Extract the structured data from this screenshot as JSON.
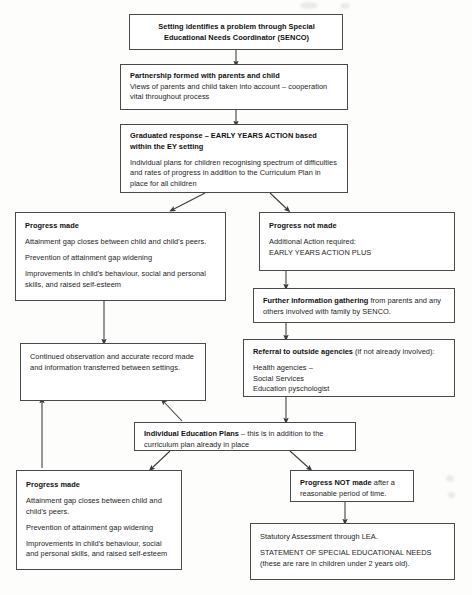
{
  "diagram": {
    "nodes": [
      {
        "id": "senco",
        "heading": "Setting identifies a problem through Special",
        "heading2": "Educational Needs Coordinator (SENCO)",
        "body": []
      },
      {
        "id": "partnership",
        "heading": "Partnership formed with parents and child",
        "body": [
          "Views of parents and child taken into account – cooperation vital throughout process"
        ]
      },
      {
        "id": "graduated",
        "heading": "Graduated response – EARLY YEARS ACTION based within the EY setting",
        "heading_plain_prefix": "Graduated response – ",
        "heading_caps": "EARLY YEARS ACTION",
        "heading_plain_suffix": " based within the EY setting",
        "body": [
          "Individual plans for children recognising spectrum of difficulties and rates of progress in addition to the Curriculum Plan in place for all children"
        ]
      },
      {
        "id": "progress-made-1",
        "heading": "Progress made",
        "body": [
          "Attainment gap closes between child and child's peers.",
          "Prevention of attainment gap widening",
          "Improvements in child's behaviour, social and personal skills, and raised self-esteem"
        ]
      },
      {
        "id": "progress-not-made",
        "heading": "Progress not made",
        "body": [
          "Additional Action required:",
          "EARLY YEARS ACTION PLUS"
        ]
      },
      {
        "id": "further-info",
        "heading": "Further information gathering",
        "heading_suffix": " from parents and any others involved with family by SENCO.",
        "body": []
      },
      {
        "id": "continued-observation",
        "heading": "",
        "body": [
          "Continued observation and accurate record made and information transferred between settings."
        ]
      },
      {
        "id": "referral",
        "heading": "Referral to outside agencies",
        "heading_suffix": " (if not already involved):",
        "body": [
          "Health agencies –",
          "Social Services",
          "Education pyschologist"
        ]
      },
      {
        "id": "iep",
        "heading": "Individual Education Plans",
        "heading_suffix": " – this is in addition to the curriculum plan already in place",
        "body": []
      },
      {
        "id": "progress-made-2",
        "heading": "Progress made",
        "body": [
          "Attainment gap closes between child and child's peers.",
          "Prevention of attainment gap widening",
          "Improvements in child's behaviour, social and personal skills, and raised self-esteem"
        ]
      },
      {
        "id": "progress-not-made-2",
        "heading": "Progress NOT made",
        "heading_plain_prefix": "Progress ",
        "heading_caps": "NOT",
        "heading_plain_mid": " made",
        "heading_suffix": " after a reasonable period of time.",
        "body": []
      },
      {
        "id": "statutory",
        "heading": "",
        "body": [
          "Statutory Assessment through LEA.",
          "STATEMENT OF SPECIAL EDUCATIONAL NEEDS (these are rare in children under 2 years old)."
        ],
        "line_statutory": "Statutory Assessment through LEA.",
        "line_statement": "STATEMENT OF SPECIAL EDUCATIONAL NEEDS",
        "line_note": "(these are rare in children under 2 years old)."
      }
    ],
    "colors": {
      "box_border": "#4a4a4a",
      "box_fill": "#ffffff",
      "text": "#1c1c1c",
      "arrow": "#3a3a3a",
      "page_bg": "#fdfdfc"
    }
  }
}
